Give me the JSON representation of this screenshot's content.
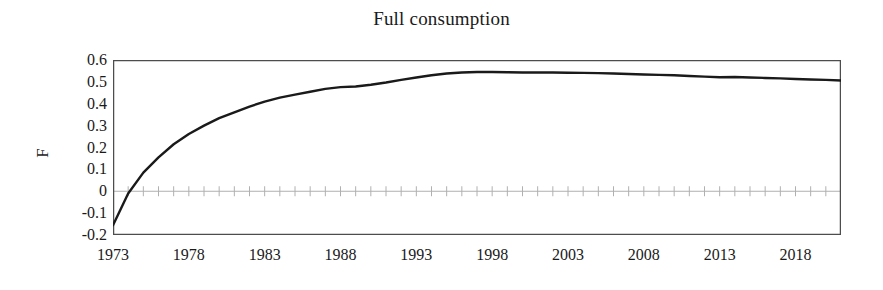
{
  "chart_data": {
    "type": "line",
    "title": "Full consumption",
    "xlabel": "",
    "ylabel": "F",
    "xlim": [
      1973,
      2021
    ],
    "ylim": [
      -0.2,
      0.6
    ],
    "grid": false,
    "zero_line": true,
    "legend": null,
    "y_ticks": [
      "0.6",
      "0.5",
      "0.4",
      "0.3",
      "0.2",
      "0.1",
      "0",
      "-0.1",
      "-0.2"
    ],
    "y_tick_values": [
      0.6,
      0.5,
      0.4,
      0.3,
      0.2,
      0.1,
      0,
      -0.1,
      -0.2
    ],
    "x_ticks": [
      "1973",
      "1978",
      "1983",
      "1988",
      "1993",
      "1998",
      "2003",
      "2008",
      "2013",
      "2018"
    ],
    "x_tick_values": [
      1973,
      1978,
      1983,
      1988,
      1993,
      1998,
      2003,
      2008,
      2013,
      2018
    ],
    "x_minor_tick_step": 1,
    "series": [
      {
        "name": "F",
        "color": "#1a1a1a",
        "x": [
          1973,
          1974,
          1975,
          1976,
          1977,
          1978,
          1979,
          1980,
          1981,
          1982,
          1983,
          1984,
          1985,
          1986,
          1987,
          1988,
          1989,
          1990,
          1991,
          1992,
          1993,
          1994,
          1995,
          1996,
          1997,
          1998,
          1999,
          2000,
          2001,
          2002,
          2003,
          2004,
          2005,
          2006,
          2007,
          2008,
          2009,
          2010,
          2011,
          2012,
          2013,
          2014,
          2015,
          2016,
          2017,
          2018,
          2019,
          2020,
          2021
        ],
        "y": [
          -0.155,
          -0.01,
          0.085,
          0.155,
          0.215,
          0.262,
          0.3,
          0.334,
          0.361,
          0.387,
          0.41,
          0.428,
          0.442,
          0.455,
          0.468,
          0.476,
          0.479,
          0.487,
          0.497,
          0.509,
          0.52,
          0.53,
          0.538,
          0.543,
          0.545,
          0.545,
          0.544,
          0.543,
          0.543,
          0.543,
          0.542,
          0.541,
          0.54,
          0.538,
          0.536,
          0.534,
          0.532,
          0.53,
          0.527,
          0.524,
          0.521,
          0.522,
          0.52,
          0.518,
          0.516,
          0.513,
          0.511,
          0.509,
          0.506
        ]
      }
    ]
  },
  "axis": {
    "frame_color": "#4d4d4d",
    "zero_line_color": "#b0b0b0",
    "tick_color": "#b0b0b0"
  }
}
